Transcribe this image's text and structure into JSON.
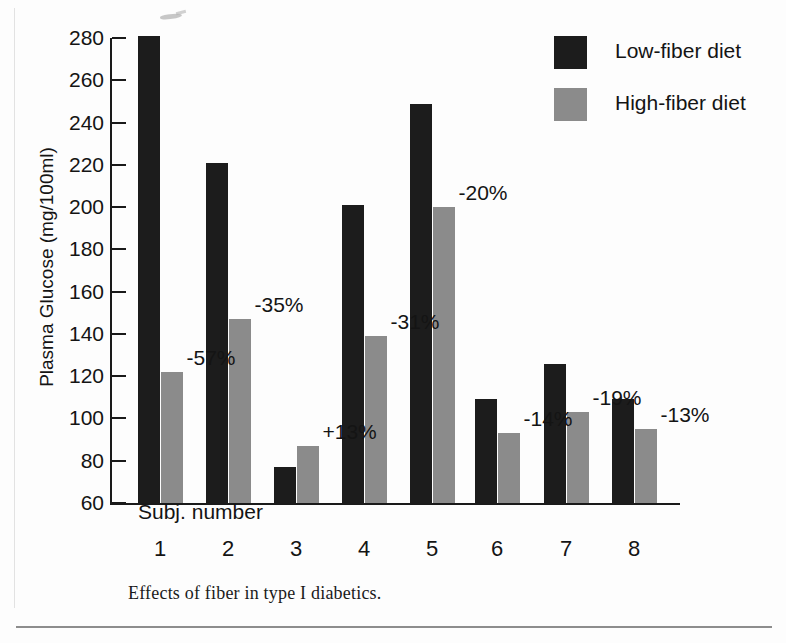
{
  "chart_data": {
    "type": "bar",
    "title": "",
    "caption": "Effects of fiber in type I diabetics.",
    "xlabel": "Subj. number",
    "ylabel": "Plasma Glucose (mg/100ml)",
    "ylim": [
      60,
      280
    ],
    "ytick_step": 20,
    "yticks": [
      280,
      260,
      240,
      220,
      200,
      180,
      160,
      140,
      120,
      100,
      80,
      60
    ],
    "categories": [
      "1",
      "2",
      "3",
      "4",
      "5",
      "6",
      "7",
      "8"
    ],
    "grid": false,
    "legend_position": "top-right",
    "series": [
      {
        "name": "Low-fiber diet",
        "color": "#1c1c1c",
        "values": [
          281,
          221,
          77,
          201,
          249,
          109,
          126,
          109
        ]
      },
      {
        "name": "High-fiber diet",
        "color": "#8b8b8b",
        "values": [
          122,
          147,
          87,
          139,
          200,
          93,
          103,
          95
        ]
      }
    ],
    "annotations": [
      "-57%",
      "-35%",
      "+13%",
      "-31%",
      "-20%",
      "-14%",
      "-19%",
      "-13%"
    ]
  },
  "axis": {
    "y_tick_labels": [
      "280",
      "260",
      "240",
      "220",
      "200",
      "180",
      "160",
      "140",
      "120",
      "100",
      "80",
      "60"
    ],
    "x_tick_labels": [
      "1",
      "2",
      "3",
      "4",
      "5",
      "6",
      "7",
      "8"
    ],
    "y_axis_title": "Plasma Glucose (mg/100ml)",
    "x_axis_title": "Subj. number"
  },
  "legend": {
    "items": [
      {
        "label": "Low-fiber diet",
        "color": "#1c1c1c"
      },
      {
        "label": "High-fiber diet",
        "color": "#8b8b8b"
      }
    ]
  },
  "annotations": {
    "percent_changes": [
      "-57%",
      "-35%",
      "+13%",
      "-31%",
      "-20%",
      "-14%",
      "-19%",
      "-13%"
    ]
  },
  "caption": {
    "text": "Effects of fiber in type I diabetics."
  },
  "colors": {
    "low_fiber": "#1c1c1c",
    "high_fiber": "#8b8b8b",
    "axis": "#1a1a1a",
    "text": "#141414",
    "page_background": "#fdfdfd",
    "rule": "#8d8d8d"
  }
}
